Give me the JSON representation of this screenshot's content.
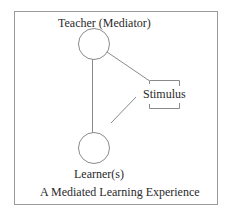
{
  "diagram": {
    "title": "A Mediated Learning Experience",
    "nodes": [
      {
        "id": "teacher",
        "label": "Teacher (Mediator)",
        "shape": "circle"
      },
      {
        "id": "stimulus",
        "label": "Stimulus",
        "shape": "bracket-box"
      },
      {
        "id": "learner",
        "label": "Learner(s)",
        "shape": "circle"
      }
    ],
    "edges": [
      {
        "from": "teacher",
        "to": "learner"
      },
      {
        "from": "teacher",
        "to": "stimulus"
      },
      {
        "from": "stimulus",
        "to": "learner"
      }
    ],
    "colors": {
      "line": "#8a8a8a",
      "frame": "#9a9a9a",
      "text": "#2a2a2a",
      "background": "#ffffff"
    }
  }
}
